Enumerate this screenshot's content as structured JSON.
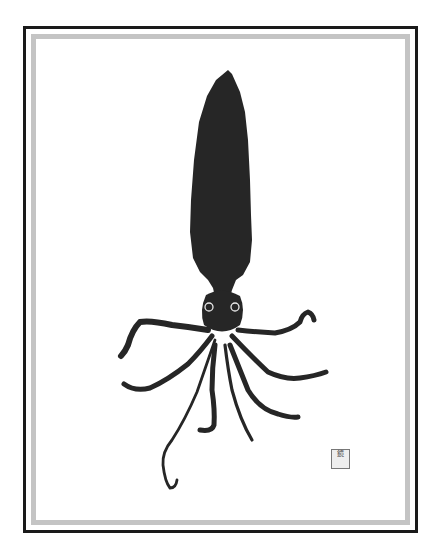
{
  "artwork": {
    "subject": "squid",
    "style": "gyotaku ink print",
    "ink_color": "#262626",
    "paper_color": "#ffffff",
    "frame": {
      "outer_line_color": "#1a1a1a",
      "inner_band_color": "#c4c4c4"
    },
    "seal": {
      "glyph": "鏡"
    }
  }
}
